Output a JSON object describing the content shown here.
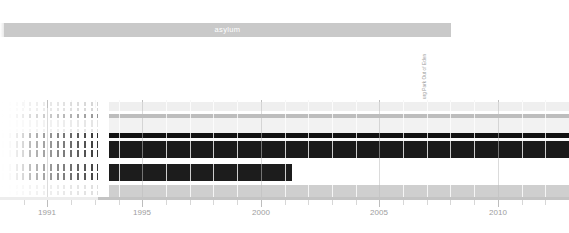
{
  "header": {
    "title": "asylum",
    "bar_color": "#c9c9c9",
    "title_color": "#ffffff"
  },
  "annotation": {
    "label": "urg Park Out of Eden",
    "color": "#9a9a9a"
  },
  "chart_data": {
    "type": "area",
    "title": "asylum",
    "xlabel": "",
    "ylabel": "",
    "xlim": [
      1989,
      2013
    ],
    "tick_labels": [
      "1991",
      "1995",
      "2000",
      "2005",
      "2010"
    ],
    "tick_values": [
      1991,
      1995,
      2000,
      2005,
      2010
    ],
    "minor_tick_values": [
      1990,
      1992,
      1993,
      1994,
      1996,
      1997,
      1998,
      1999,
      2001,
      2002,
      2003,
      2004,
      2006,
      2007,
      2008,
      2009,
      2011,
      2012
    ],
    "grid": true,
    "legend": "none",
    "series": [
      {
        "name": "band-1",
        "color": "#efefef",
        "start": 1993.6,
        "end": 2013.0,
        "y": 2,
        "height": 9
      },
      {
        "name": "band-2",
        "color": "#bdbdbd",
        "start": 1993.6,
        "end": 2013.0,
        "y": 14,
        "height": 4
      },
      {
        "name": "band-3",
        "color": "#f2f2f2",
        "start": 1993.6,
        "end": 2013.0,
        "y": 18,
        "height": 15
      },
      {
        "name": "band-4",
        "color": "#111111",
        "start": 1993.6,
        "end": 2013.0,
        "y": 33,
        "height": 5
      },
      {
        "name": "band-5",
        "color": "#fbfbfb",
        "start": 1993.6,
        "end": 2013.0,
        "y": 38,
        "height": 3
      },
      {
        "name": "band-6",
        "color": "#1a1a1a",
        "start": 1993.6,
        "end": 2013.0,
        "y": 41,
        "height": 17
      },
      {
        "name": "band-7",
        "color": "#ffffff",
        "start": 1993.6,
        "end": 2013.0,
        "y": 58,
        "height": 6
      },
      {
        "name": "band-8",
        "color": "#1c1c1c",
        "start": 1993.6,
        "end": 2001.3,
        "y": 64,
        "height": 17
      },
      {
        "name": "band-9",
        "color": "#ffffff",
        "start": 1993.6,
        "end": 2013.0,
        "y": 81,
        "height": 4
      },
      {
        "name": "band-10",
        "color": "#cfcfcf",
        "start": 1993.6,
        "end": 2013.0,
        "y": 85,
        "height": 12
      }
    ],
    "comb": {
      "description": "left fading dashed transition region",
      "start": 1989.0,
      "end": 1993.6,
      "columns": 16,
      "rows": [
        {
          "y": 2,
          "height": 9,
          "color": "#d0d0d0"
        },
        {
          "y": 14,
          "height": 4,
          "color": "#8c8c8c"
        },
        {
          "y": 20,
          "height": 12,
          "color": "#e2e2e2"
        },
        {
          "y": 33,
          "height": 5,
          "color": "#202020"
        },
        {
          "y": 41,
          "height": 17,
          "color": "#262626"
        },
        {
          "y": 64,
          "height": 17,
          "color": "#2b2b2b"
        },
        {
          "y": 85,
          "height": 12,
          "color": "#dcdcdc"
        }
      ]
    }
  },
  "axis": {
    "line_color": "#c4c4c4",
    "label_color": "#9e9e9e"
  }
}
